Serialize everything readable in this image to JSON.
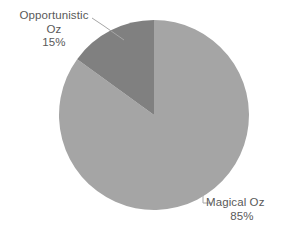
{
  "chart_data": {
    "type": "pie",
    "title": "",
    "subtitle": "",
    "categories": [
      "Magical Oz",
      "Opportunistic Oz"
    ],
    "values": [
      85,
      15
    ],
    "value_unit": "%",
    "labels": [
      "85%",
      "15%"
    ],
    "legend": "none",
    "grid": false,
    "slices": [
      {
        "name": "Magical Oz",
        "value": 85,
        "label": "Magical Oz",
        "percent_label": "85%",
        "color": "#a5a5a5",
        "start_angle_deg": 0,
        "end_angle_deg": 306
      },
      {
        "name": "Opportunistic Oz",
        "value": 15,
        "label": "Opportunistic Oz",
        "percent_label": "15%",
        "color": "#808080",
        "start_angle_deg": 306,
        "end_angle_deg": 360
      }
    ]
  },
  "labels": {
    "opportunistic": {
      "line1": "Opportunistic",
      "line2": "Oz",
      "percent": "15%"
    },
    "magical": {
      "name": "Magical Oz",
      "percent": "85%"
    }
  },
  "colors": {
    "background": "#ffffff",
    "slice_major": "#a5a5a5",
    "slice_minor": "#808080",
    "text": "#595959",
    "leader_line": "#a6a6a6"
  }
}
